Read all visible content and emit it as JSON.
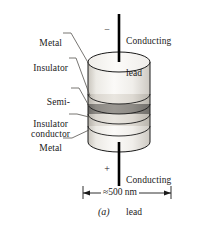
{
  "figure": {
    "caption": "(a)"
  },
  "leads": {
    "top": {
      "label_line1": "Conducting",
      "label_line2": "lead",
      "polarity": "−"
    },
    "bottom": {
      "label_line1": "Conducting",
      "label_line2": "lead",
      "polarity": "+"
    }
  },
  "layer_labels": [
    {
      "id": "metal-top",
      "line1": "Metal",
      "line2": ""
    },
    {
      "id": "insulator-top",
      "line1": "Insulator",
      "line2": ""
    },
    {
      "id": "semiconductor",
      "line1": "Semi-",
      "line2": "conductor"
    },
    {
      "id": "insulator-bot",
      "line1": "Insulator",
      "line2": ""
    },
    {
      "id": "metal-bot",
      "line1": "Metal",
      "line2": ""
    }
  ],
  "dimension": {
    "value": "≈500 nm"
  },
  "colors": {
    "outline": "#1a1a1a",
    "metal": "#f2f0ec",
    "insulator": "#ded9d2",
    "semiconductor": "#8a8782",
    "top_face": "#f7f6f3",
    "leader": "#55534f",
    "lead": "#000000"
  }
}
